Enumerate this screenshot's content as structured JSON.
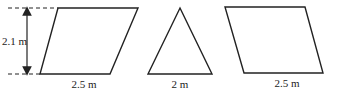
{
  "figure": {
    "shapes": [
      {
        "type": "parallelogram",
        "base_label": "2.5 m",
        "height_label": "2.1 m"
      },
      {
        "type": "triangle",
        "base_label": "2 m"
      },
      {
        "type": "parallelogram",
        "base_label": "2.5 m"
      }
    ],
    "colors": {
      "stroke": "#222222",
      "background": "#ffffff"
    }
  }
}
